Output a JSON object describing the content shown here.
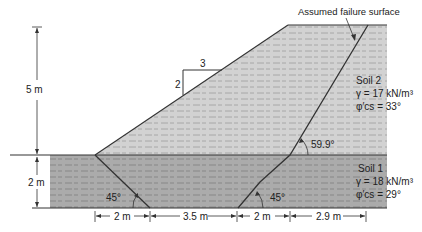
{
  "diagram": {
    "annotation": "Assumed failure surface",
    "slope_ratio": {
      "vertical": "2",
      "horizontal": "3"
    },
    "heights": {
      "upper": "5 m",
      "lower": "2 m"
    },
    "angles": {
      "upper_failure": "59.9°",
      "lower_left": "45°",
      "lower_right": "45°"
    },
    "bottom_dims": [
      "2 m",
      "3.5 m",
      "2 m",
      "2.9 m"
    ],
    "soil2": {
      "name": "Soil 2",
      "gamma": "γ = 17 kN/m³",
      "phi": "φ′cs = 33°"
    },
    "soil1": {
      "name": "Soil 1",
      "gamma": "γ = 18 kN/m³",
      "phi": "φ′cs = 29°"
    },
    "colors": {
      "soil2_fill": "#cfcfcf",
      "soil1_fill": "#a9a9a9",
      "line": "#333333",
      "hatch": "#8d8d8d"
    }
  }
}
